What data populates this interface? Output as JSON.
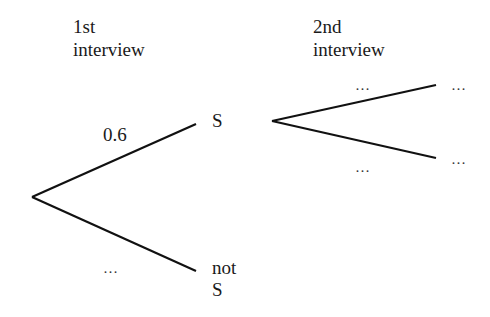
{
  "diagram": {
    "type": "probability-tree",
    "stages": [
      {
        "line1": "1st",
        "line2": "interview"
      },
      {
        "line1": "2nd",
        "line2": "interview"
      }
    ],
    "first_stage": {
      "upper_branch": {
        "probability": "0.6",
        "outcome": "S"
      },
      "lower_branch": {
        "probability": "…",
        "outcome_line1": "not",
        "outcome_line2": "S"
      }
    },
    "second_stage": {
      "upper_branch": {
        "probability": "…",
        "outcome": "…"
      },
      "lower_branch": {
        "probability": "…",
        "outcome": "…"
      }
    },
    "colors": {
      "line": "#111111",
      "text": "#1a1a1a",
      "background": "#ffffff"
    }
  }
}
